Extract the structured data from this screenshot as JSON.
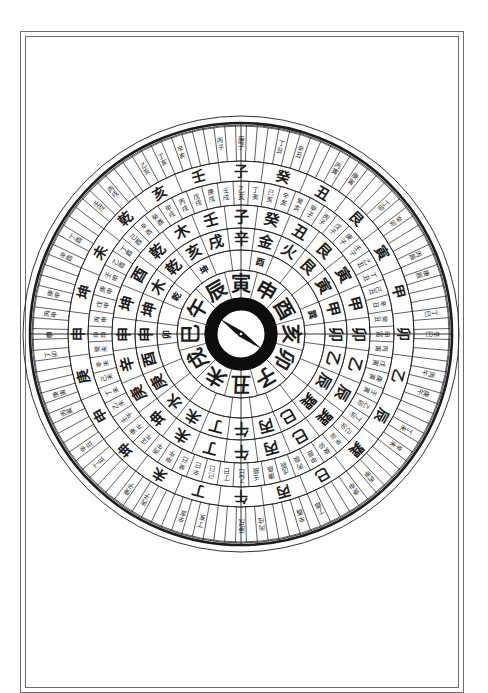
{
  "page": {
    "ink_color": "#1c1c1c",
    "paper_color": "#ffffff",
    "frame_color": "#6b6b6b"
  },
  "compass": {
    "needle": "compass-needle",
    "rings": [
      {
        "id": "ring-earthly-branches",
        "divisions": 12,
        "start_offset_deg": -15,
        "labels": [
          "巳",
          "午",
          "辰",
          "寅",
          "申",
          "酉",
          "亥",
          "卯",
          "子",
          "丑",
          "未",
          "戌"
        ]
      },
      {
        "id": "ring-annotations",
        "divisions": 24,
        "start_offset_deg": -7.5,
        "labels": [
          "卯",
          "",
          "乾",
          "",
          "坤",
          "",
          "",
          "酉",
          "",
          "",
          "",
          "巽",
          "",
          "",
          "",
          "",
          "",
          "",
          "",
          "",
          "",
          "",
          "",
          ""
        ]
      },
      {
        "id": "ring-24-mountains-inner",
        "divisions": 24,
        "start_offset_deg": -7.5,
        "labels": [
          "申",
          "坤",
          "木",
          "乾",
          "亥",
          "戌",
          "辛",
          "金",
          "火",
          "艮",
          "寅",
          "甲",
          "卯",
          "乙",
          "辰",
          "巽",
          "巳",
          "丙",
          "午",
          "丁",
          "未",
          "水",
          "庚",
          "酉"
        ]
      },
      {
        "id": "ring-mixed",
        "divisions": 24,
        "start_offset_deg": -7.5,
        "labels": [
          "申",
          "坤",
          "酉",
          "乾",
          "木",
          "壬",
          "子",
          "癸",
          "丑",
          "艮",
          "寅",
          "甲",
          "卯",
          "乙",
          "辰",
          "巽",
          "巳",
          "丙",
          "午",
          "丁",
          "未",
          "坤",
          "庚",
          "辛"
        ]
      },
      {
        "id": "ring-sixty-jiazi",
        "divisions": 60,
        "start_offset_deg": -3,
        "labels": [
          "甲申",
          "丙申",
          "戊申",
          "庚申",
          "壬申",
          "乙酉",
          "丁酉",
          "己酉",
          "辛酉",
          "癸酉",
          "甲戌",
          "丙戌",
          "戊戌",
          "庚戌",
          "壬戌",
          "乙亥",
          "丁亥",
          "己亥",
          "辛亥",
          "癸亥",
          "甲子",
          "丙子",
          "戊子",
          "庚子",
          "壬子",
          "乙丑",
          "丁丑",
          "己丑",
          "辛丑",
          "癸丑",
          "甲寅",
          "丙寅",
          "戊寅",
          "庚寅",
          "壬寅",
          "乙卯",
          "丁卯",
          "己卯",
          "辛卯",
          "癸卯",
          "甲辰",
          "丙辰",
          "戊辰",
          "庚辰",
          "壬辰",
          "乙巳",
          "丁巳",
          "己巳",
          "辛巳",
          "癸巳",
          "甲午",
          "丙午",
          "戊午",
          "庚午",
          "壬午",
          "乙未",
          "丁未",
          "己未",
          "辛未",
          "癸未"
        ]
      },
      {
        "id": "ring-24-mountains-outer",
        "divisions": 24,
        "start_offset_deg": -7.5,
        "labels": [
          "申",
          "坤",
          "未",
          "乾",
          "亥",
          "壬",
          "子",
          "癸",
          "丑",
          "艮",
          "寅",
          "甲",
          "卯",
          "乙",
          "辰",
          "巽",
          "巳",
          "丙",
          "午",
          "丁",
          "未",
          "坤",
          "申",
          "庚"
        ]
      },
      {
        "id": "ring-120-divisions",
        "divisions": 120,
        "start_offset_deg": -1.5,
        "labels": [
          "申",
          "",
          "丙申",
          "",
          "庚申",
          "",
          "",
          "",
          "辛酉",
          "",
          "丁酉",
          "",
          "",
          "",
          "壬戌",
          "",
          "丙戌",
          "",
          "",
          "",
          "乙亥",
          "",
          "丁亥",
          "",
          "辛亥",
          "",
          "",
          "",
          "丙子",
          "",
          "庚子",
          "",
          "",
          "",
          "丁丑",
          "",
          "辛丑",
          "",
          "",
          "",
          "丙寅",
          "",
          "庚寅",
          "",
          "",
          "",
          "丁卯",
          "",
          "辛卯",
          "",
          "",
          "",
          "丙辰",
          "",
          "庚辰",
          "",
          "",
          "",
          "丁巳",
          "",
          "辛巳",
          "",
          "",
          "",
          "丙午",
          "",
          "庚午",
          "",
          "",
          "",
          "丁未",
          "",
          "辛未",
          "",
          "",
          "",
          "丙申",
          "",
          "庚申",
          "",
          "",
          "",
          "丁酉",
          "",
          "辛酉",
          "",
          "",
          "",
          "丙戌",
          "",
          "庚戌",
          "",
          "",
          "",
          "丁亥",
          "",
          "辛亥",
          "",
          "",
          "",
          "丙子",
          "",
          "庚子",
          "",
          "",
          "",
          "丁丑",
          "",
          "辛丑",
          "",
          "",
          "",
          "丙寅",
          "",
          "庚寅",
          "",
          "",
          "",
          "丁卯",
          "",
          "辛卯",
          "",
          "",
          "",
          "丙辰",
          "",
          "庚辰",
          "",
          ""
        ]
      }
    ]
  }
}
